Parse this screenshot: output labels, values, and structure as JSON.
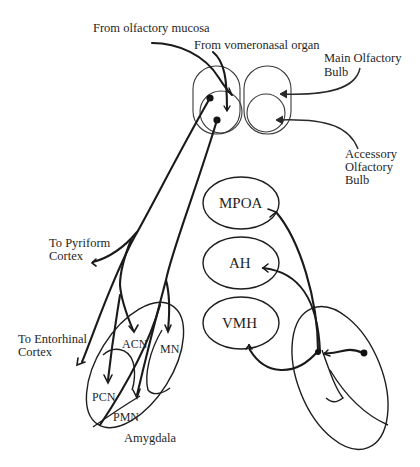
{
  "figure": {
    "type": "schematic",
    "colors": {
      "line": "#1a1a1a",
      "outline": "#3a3a3a",
      "background": "#ffffff"
    }
  },
  "labels": {
    "from_olfactory_mucosa": "From olfactory mucosa",
    "from_vomeronasal_organ": "From vomeronasal organ",
    "main_olfactory_bulb": [
      "Main Olfactory",
      "Bulb"
    ],
    "accessory_olfactory_bulb": [
      "Accessory",
      "Olfactory",
      "Bulb"
    ],
    "to_pyriform_cortex": [
      "To Pyriform",
      "Cortex"
    ],
    "to_entorhinal_cortex": [
      "To Entorhinal",
      "Cortex"
    ],
    "amygdala": "Amygdala"
  },
  "amygdala_nuclei": {
    "acn": "ACN",
    "mn": "MN",
    "pcn": "PCN",
    "pmn": "PMN"
  },
  "hypothalamic_nuclei": {
    "mpoa": "MPOA",
    "ah": "AH",
    "vmh": "VMH"
  },
  "caption": {
    "visible": "clipped at bottom edge; text not legible"
  }
}
